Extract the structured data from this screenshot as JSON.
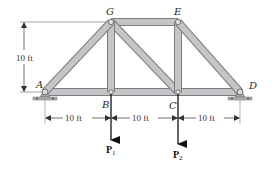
{
  "figure": {
    "type": "truss",
    "joints": [
      {
        "id": "A",
        "label": "A"
      },
      {
        "id": "B",
        "label": "B"
      },
      {
        "id": "C",
        "label": "C"
      },
      {
        "id": "D",
        "label": "D"
      },
      {
        "id": "E",
        "label": "E"
      },
      {
        "id": "G",
        "label": "G"
      }
    ],
    "members": [
      "AG",
      "AB",
      "BG",
      "GE",
      "GC",
      "BC",
      "CE",
      "ED",
      "CD"
    ],
    "supports": [
      {
        "joint": "A",
        "type": "pin"
      },
      {
        "joint": "D",
        "type": "pin"
      }
    ],
    "dimensions": {
      "height": "10 ft",
      "span_AB": "10 ft",
      "span_BC": "10 ft",
      "span_CD": "10 ft"
    },
    "loads": [
      {
        "joint": "B",
        "name": "P",
        "subscript": "1",
        "direction": "down"
      },
      {
        "joint": "C",
        "name": "P",
        "subscript": "2",
        "direction": "down"
      }
    ],
    "colors": {
      "member_fill": "#b9bcbe",
      "member_edge": "#7a7d80",
      "pin": "#8a8d90",
      "ground": "#a9abad",
      "arrow": "#111111",
      "dim_line": "#444444"
    }
  }
}
